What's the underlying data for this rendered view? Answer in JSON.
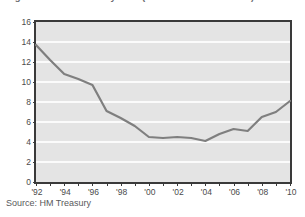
{
  "figure": {
    "title": "Figure 3.3: HM Treasury debt (£bn – constant 2010/11)",
    "source_note": "Source: HM Treasury"
  },
  "chart_data": {
    "type": "line",
    "title": "Figure 3.3: HM Treasury debt (£bn – constant 2010/11)",
    "xlabel": "",
    "ylabel": "",
    "xlim": [
      1992,
      2010
    ],
    "ylim": [
      0,
      16
    ],
    "ytick_values": [
      0,
      2,
      4,
      6,
      8,
      10,
      12,
      14,
      16
    ],
    "ytick_labels": [
      "0",
      "2",
      "4",
      "6",
      "8",
      "10",
      "12",
      "14",
      "16"
    ],
    "xtick_values": [
      1992,
      1994,
      1996,
      1998,
      2000,
      2002,
      2004,
      2006,
      2008,
      2010
    ],
    "xtick_labels": [
      "'92",
      "'94",
      "'96",
      "'98",
      "'00",
      "'02",
      "'04",
      "'06",
      "'08",
      "'10"
    ],
    "minor_xticks_every": 1,
    "grid": "horizontal",
    "legend": "none",
    "line_color": "#7f7f7f",
    "plot_background": "#e4e4e4",
    "gridline_color": "#fbfbfb",
    "axis_color": "#3a3a3a",
    "x": [
      1992,
      1993,
      1994,
      1995,
      1996,
      1997,
      1998,
      1999,
      2000,
      2001,
      2002,
      2003,
      2004,
      2005,
      2006,
      2007,
      2008,
      2009,
      2010
    ],
    "values": [
      13.7,
      12.2,
      10.8,
      10.3,
      9.7,
      7.1,
      6.4,
      5.6,
      4.5,
      4.4,
      4.5,
      4.4,
      4.1,
      4.8,
      5.3,
      5.1,
      6.5,
      7.0,
      8.1
    ]
  }
}
